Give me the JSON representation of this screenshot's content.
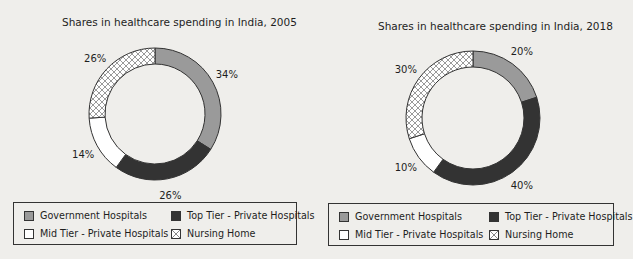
{
  "colors": {
    "government": "#9a9a9a",
    "top_tier": "#333333",
    "mid_tier": "#ffffff",
    "nursing": "hatch",
    "background": "#efeeeb",
    "stroke": "#333333"
  },
  "legend": {
    "items": [
      {
        "label": "Government Hospitals",
        "key": "government"
      },
      {
        "label": "Top Tier - Private Hospitals",
        "key": "top_tier"
      },
      {
        "label": "Mid Tier - Private Hospitals",
        "key": "mid_tier"
      },
      {
        "label": "Nursing Home",
        "key": "nursing"
      }
    ]
  },
  "chart_data": [
    {
      "type": "pie",
      "variant": "donut",
      "title": "Shares in healthcare spending in India, 2005",
      "categories": [
        "Government Hospitals",
        "Top Tier - Private Hospitals",
        "Mid Tier - Private Hospitals",
        "Nursing Home"
      ],
      "values": [
        34,
        26,
        14,
        26
      ],
      "labels": [
        "34%",
        "26%",
        "14%",
        "26%"
      ],
      "legend_position": "bottom",
      "start_angle": "12 o'clock, clockwise"
    },
    {
      "type": "pie",
      "variant": "donut",
      "title": "Shares in healthcare spending in India, 2018",
      "categories": [
        "Government Hospitals",
        "Top Tier - Private Hospitals",
        "Mid Tier - Private Hospitals",
        "Nursing Home"
      ],
      "values": [
        20,
        40,
        10,
        30
      ],
      "labels": [
        "20%",
        "40%",
        "10%",
        "30%"
      ],
      "legend_position": "bottom",
      "start_angle": "12 o'clock, clockwise"
    }
  ]
}
